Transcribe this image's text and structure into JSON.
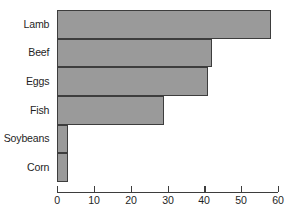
{
  "chart_data": {
    "type": "bar",
    "orientation": "horizontal",
    "title": "",
    "xlabel": "",
    "ylabel": "",
    "categories": [
      "Lamb",
      "Beef",
      "Eggs",
      "Fish",
      "Soybeans",
      "Corn"
    ],
    "values": [
      58,
      42,
      41,
      29,
      3,
      3
    ],
    "xlim": [
      0,
      60
    ],
    "xticks": [
      0,
      10,
      20,
      30,
      40,
      50,
      60
    ],
    "xtick_labels": [
      "0",
      "10",
      "20",
      "30",
      "40",
      "50",
      "60"
    ],
    "grid": false,
    "legend": false,
    "bar_fill_color": "#9a9a9a",
    "bar_edge_color": "#3d3d3d",
    "axis_color": "#3d3d3d",
    "text_color": "#1f1f1f",
    "background_color": "#ffffff"
  }
}
